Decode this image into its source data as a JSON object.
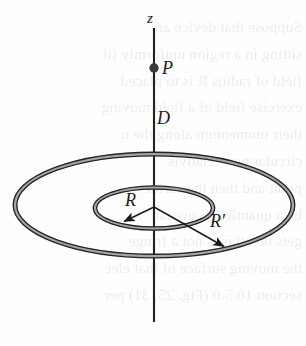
{
  "figure": {
    "name": "two-concentric-rings-on-z-axis",
    "background_color": "#fefefe",
    "ink_color": "#1b1b1b",
    "ring_fill_color": "#a8a8a8"
  },
  "labels": {
    "axis": "z",
    "point": "P",
    "distance": "D",
    "inner_radius": "R",
    "outer_radius": "R′"
  },
  "axis": {
    "x": 154,
    "y_top": 28,
    "y_bottom": 322,
    "stroke_width": 2
  },
  "point_marker": {
    "name": "point-P",
    "cx": 154,
    "cy": 68,
    "r": 4.6
  },
  "rings": [
    {
      "name": "inner-ring",
      "label": "R",
      "cx": 154,
      "cy": 208,
      "rx": 59,
      "ry": 20.5,
      "tube_width": 3.4
    },
    {
      "name": "outer-ring",
      "label": "R′",
      "cx": 154,
      "cy": 205,
      "rx": 139,
      "ry": 51,
      "tube_width": 3.6
    }
  ],
  "radius_arrows": [
    {
      "name": "radius-arrow-R",
      "label": "R",
      "from_x": 154,
      "from_y": 207,
      "to_x": 121,
      "to_y": 223
    },
    {
      "name": "radius-arrow-R-prime",
      "label": "R′",
      "from_x": 154,
      "from_y": 207,
      "to_x": 228,
      "to_y": 249
    }
  ],
  "page_bleed_text": "Suppose that device are\nsitting in a region uniformly fil\nfield of radius R is to placed\nexercise field of a field moving\ntheir momentum along the u\ncircular non-relativis\npoint and then the surfac\nbe a quantity (Gaussian\ngets the, this is not a fringe\nthe moving surface of that elec\nsection 10.5.0 (Fig. 25. 31) per"
}
